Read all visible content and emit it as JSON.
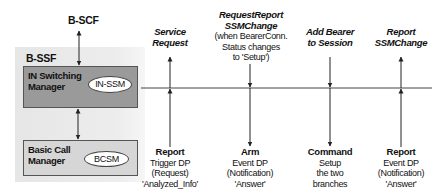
{
  "scf": {
    "label": "B-SCF"
  },
  "ssf": {
    "label": "B-SSF"
  },
  "in_switching_manager": {
    "title_line1": "IN Switching",
    "title_line2": "Manager",
    "state_machine": "IN-SSM"
  },
  "basic_call_manager": {
    "title_line1": "Basic Call",
    "title_line2": "Manager",
    "state_machine": "BCSM"
  },
  "columns": [
    {
      "top": {
        "title_lines": [
          "Service",
          "Request"
        ],
        "plain_lines": []
      },
      "arrow_direction": "up",
      "bottom": {
        "title": "Report",
        "lines": [
          "Trigger DP",
          "(Request)",
          "'Analyzed_Info'"
        ]
      }
    },
    {
      "top": {
        "title_lines": [
          "RequestReport",
          "SSMChange"
        ],
        "plain_lines": [
          "(when BearerConn.",
          "Status changes",
          "to 'Setup')"
        ]
      },
      "arrow_direction": "down",
      "bottom": {
        "title": "Arm",
        "lines": [
          "Event DP",
          "(Notification)",
          "'Answer'"
        ]
      }
    },
    {
      "top": {
        "title_lines": [
          "Add Bearer",
          "to Session"
        ],
        "plain_lines": []
      },
      "arrow_direction": "down",
      "bottom": {
        "title": "Command",
        "lines": [
          "Setup",
          "the two",
          "branches"
        ]
      }
    },
    {
      "top": {
        "title_lines": [
          "Report",
          "SSMChange"
        ],
        "plain_lines": []
      },
      "arrow_direction": "up",
      "bottom": {
        "title": "Report",
        "lines": [
          "Event DP",
          "(Notification)",
          "'Answer'"
        ]
      }
    }
  ],
  "colors": {
    "in_switching_box": "#9a9a9a",
    "basic_call_box": "#d6d6d6",
    "panel": "#ebebeb",
    "line": "#333333"
  }
}
